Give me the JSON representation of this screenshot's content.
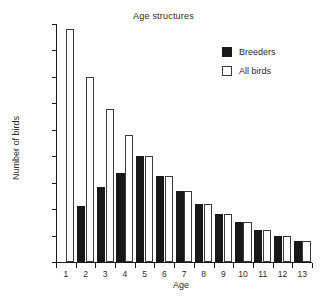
{
  "chart_data": {
    "type": "bar",
    "title": "Age structures",
    "xlabel": "Age",
    "ylabel": "Number of birds",
    "categories": [
      "1",
      "2",
      "3",
      "4",
      "5",
      "6",
      "7",
      "8",
      "9",
      "10",
      "11",
      "12",
      "13"
    ],
    "series": [
      {
        "name": "Breeders",
        "color": "#181818",
        "values": [
          0,
          42,
          57,
          67,
          80,
          65,
          54,
          44,
          36,
          30,
          24,
          20,
          16
        ]
      },
      {
        "name": "All birds",
        "color": "#ffffff",
        "values": [
          176,
          140,
          116,
          96,
          80,
          65,
          54,
          44,
          36,
          30,
          24,
          20,
          16
        ]
      }
    ],
    "ylim": [
      0,
      180
    ],
    "yticks": [
      0,
      20,
      40,
      60,
      80,
      100,
      120,
      140,
      160,
      180
    ],
    "grid": false,
    "legend_position": "top-right"
  },
  "legend": {
    "items": [
      {
        "label": "Breeders",
        "swatch": "filled-square"
      },
      {
        "label": "All birds",
        "swatch": "open-square"
      }
    ]
  }
}
